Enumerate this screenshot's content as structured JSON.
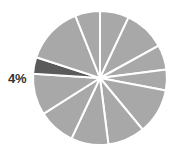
{
  "chart_data": {
    "type": "pie",
    "title": "",
    "subtitle": "",
    "xlabel": "",
    "ylabel": "",
    "legend": false,
    "grid": false,
    "center": {
      "cx": 100,
      "cy": 78
    },
    "radius": 67,
    "start_angle_deg": -90,
    "direction": "clockwise",
    "separator_color": "#ffffff",
    "separator_width": 2,
    "highlight_color": "#5a5a5a",
    "base_color": "#a8a8a8",
    "labels_shown": [
      "4%"
    ],
    "categories": [
      "Slice 1",
      "Slice 2",
      "Slice 3",
      "Slice 4",
      "Slice 5",
      "Slice 6",
      "Slice 7",
      "Slice 8",
      "Slice 9",
      "Slice 10",
      "Slice 11",
      "Slice 12"
    ],
    "values": [
      7,
      10,
      6,
      5,
      11,
      9,
      9,
      9,
      10,
      4,
      14,
      6
    ],
    "slices": [
      {
        "name": "Slice 1",
        "value": 7,
        "color": "#a8a8a8",
        "label": "",
        "label_visible": false
      },
      {
        "name": "Slice 2",
        "value": 10,
        "color": "#a8a8a8",
        "label": "",
        "label_visible": false
      },
      {
        "name": "Slice 3",
        "value": 6,
        "color": "#a8a8a8",
        "label": "",
        "label_visible": false
      },
      {
        "name": "Slice 4",
        "value": 5,
        "color": "#a8a8a8",
        "label": "",
        "label_visible": false
      },
      {
        "name": "Slice 5",
        "value": 11,
        "color": "#a8a8a8",
        "label": "",
        "label_visible": false
      },
      {
        "name": "Slice 6",
        "value": 9,
        "color": "#a8a8a8",
        "label": "",
        "label_visible": false
      },
      {
        "name": "Slice 7",
        "value": 9,
        "color": "#a8a8a8",
        "label": "",
        "label_visible": false
      },
      {
        "name": "Slice 8",
        "value": 9,
        "color": "#a8a8a8",
        "label": "",
        "label_visible": false
      },
      {
        "name": "Slice 9",
        "value": 10,
        "color": "#a8a8a8",
        "label": "",
        "label_visible": false
      },
      {
        "name": "Slice 10",
        "value": 4,
        "color": "#5a5a5a",
        "label": "4%",
        "label_visible": true
      },
      {
        "name": "Slice 11",
        "value": 14,
        "color": "#a8a8a8",
        "label": "",
        "label_visible": false
      },
      {
        "name": "Slice 12",
        "value": 6,
        "color": "#a8a8a8",
        "label": "",
        "label_visible": false
      }
    ]
  },
  "labels": {
    "dark_slice_percent": "4%"
  },
  "colors": {
    "background": "#ffffff",
    "pie_base": "#a8a8a8",
    "pie_highlight": "#5a5a5a",
    "separator": "#ffffff",
    "label_text": "#333333"
  }
}
